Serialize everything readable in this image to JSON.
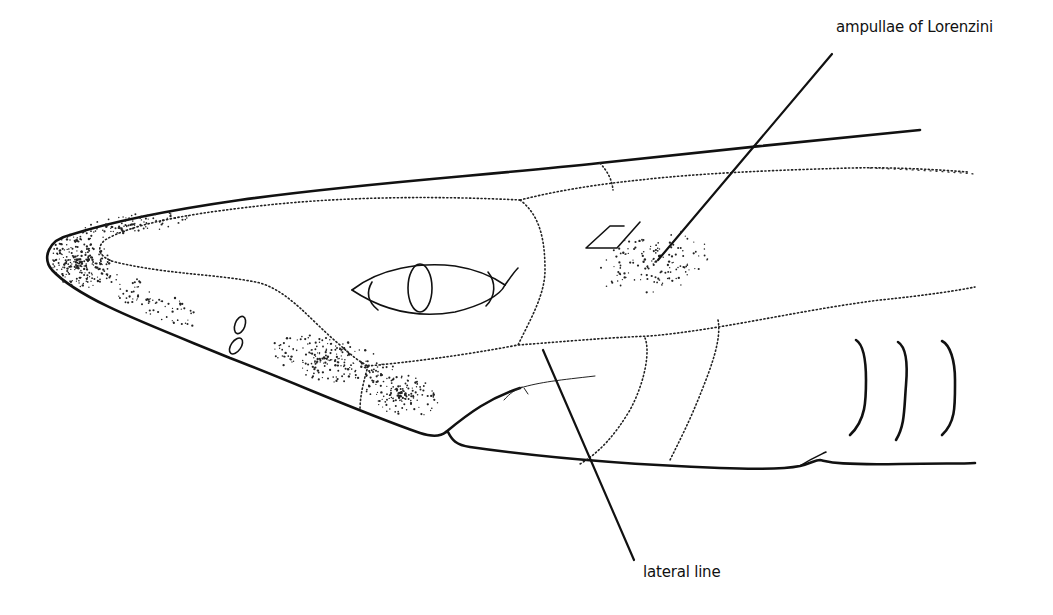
{
  "figure": {
    "labels": {
      "ampullae": "ampullae of Lorenzini",
      "lateral_line": "lateral line"
    },
    "structures": [
      "snout",
      "nostril",
      "eye",
      "spiracle",
      "ampullae of Lorenzini",
      "lateral line",
      "mouth",
      "gill slits"
    ],
    "gill_slit_count": 3,
    "colors": {
      "ink": "#111111",
      "background": "#ffffff"
    }
  }
}
